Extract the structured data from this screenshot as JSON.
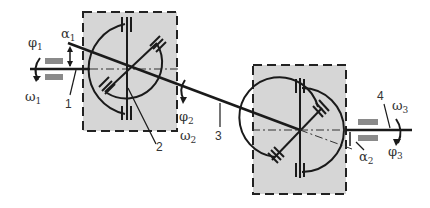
{
  "diagram": {
    "type": "double cardan joint (universal joint) kinematic scheme",
    "labels": {
      "phi1": {
        "sym": "φ",
        "sub": "1"
      },
      "omega1": {
        "sym": "ω",
        "sub": "1"
      },
      "alpha1": {
        "sym": "α",
        "sub": "1"
      },
      "phi2": {
        "sym": "φ",
        "sub": "2"
      },
      "omega2": {
        "sym": "ω",
        "sub": "2"
      },
      "alpha2": {
        "sym": "α",
        "sub": "2"
      },
      "phi3": {
        "sym": "φ",
        "sub": "3"
      },
      "omega3": {
        "sym": "ω",
        "sub": "3"
      }
    },
    "part_numbers": {
      "n1": "1",
      "n2": "2",
      "n3": "3",
      "n4": "4"
    },
    "colors": {
      "line": "#1a1a1a",
      "box_fill": "#d6d6d6",
      "bearing": "#8a8a8a",
      "background": "#ffffff"
    }
  }
}
